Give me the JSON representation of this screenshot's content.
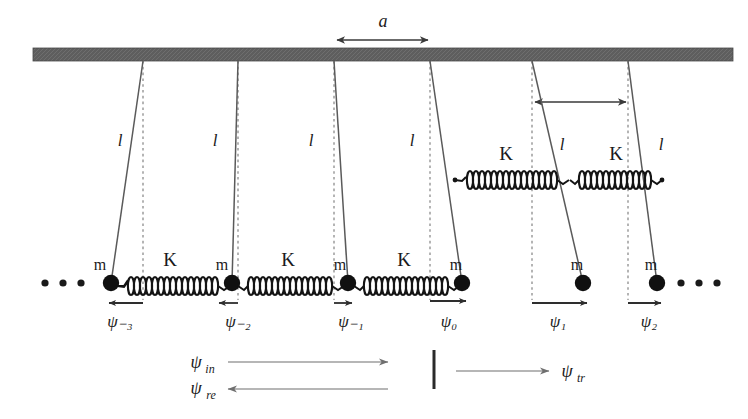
{
  "figure": {
    "colors": {
      "ceiling": "#595959",
      "ink": "#1a1a1a",
      "rod": "#555555",
      "dashed": "#8a8a8a",
      "arrow": "#3a3a3a",
      "faint_arrow": "#7a7a7a",
      "spring": "#141414",
      "mass": "#101010"
    },
    "ceiling": {
      "x": 33,
      "y": 48,
      "width": 700,
      "height": 13
    },
    "lattice_spacing": {
      "label": "a",
      "arrow_y": 40,
      "x_start": 335,
      "x_end": 430,
      "label_x": 383,
      "label_y": 26
    },
    "spacing_arrow_right": {
      "arrow_y": 102,
      "x_start": 533,
      "x_end": 628
    },
    "rod_length_label": "l",
    "spring_label": "K",
    "mass_label": "m",
    "ellipsis_left": {
      "x_positions": [
        45,
        63,
        81
      ],
      "y": 283
    },
    "ellipsis_right": {
      "x_positions": [
        681,
        699,
        717
      ],
      "y": 283
    },
    "pendulums": [
      {
        "id": "psi-minus-3",
        "pivot_x": 143,
        "mass_x": 111,
        "mass_y": 283,
        "displacement_label": "ψ₋₃",
        "displacement_sign": "negative",
        "arrow_length": 36,
        "label_x": 120,
        "label_y": 325,
        "l_label_x": 120,
        "l_label_y": 146,
        "m_label_x": 100,
        "m_label_y": 266,
        "spring_raised": false
      },
      {
        "id": "psi-minus-2",
        "pivot_x": 238,
        "mass_x": 232,
        "mass_y": 283,
        "displacement_label": "ψ₋₂",
        "displacement_sign": "negative",
        "arrow_length": 20,
        "label_x": 238,
        "label_y": 325,
        "l_label_x": 215,
        "l_label_y": 146,
        "m_label_x": 222,
        "m_label_y": 266,
        "spring_raised": false
      },
      {
        "id": "psi-minus-1",
        "pivot_x": 334,
        "mass_x": 348,
        "mass_y": 283,
        "displacement_label": "ψ₋₁",
        "displacement_sign": "positive",
        "arrow_length": 18,
        "label_x": 351,
        "label_y": 325,
        "l_label_x": 311,
        "l_label_y": 146,
        "m_label_x": 340,
        "m_label_y": 266,
        "spring_raised": false
      },
      {
        "id": "psi-0",
        "pivot_x": 430,
        "mass_x": 462,
        "mass_y": 283,
        "displacement_label": "ψ₀",
        "displacement_sign": "positive",
        "arrow_length": 36,
        "label_x": 447,
        "label_y": 325,
        "l_label_x": 412,
        "l_label_y": 146,
        "m_label_x": 455,
        "m_label_y": 266,
        "spring_raised": true
      },
      {
        "id": "psi-1",
        "pivot_x": 532,
        "mass_x": 583,
        "mass_y": 283,
        "displacement_label": "ψ₁",
        "displacement_sign": "positive",
        "arrow_length": 53,
        "label_x": 556,
        "label_y": 325,
        "l_label_x": 562,
        "l_label_y": 146,
        "m_label_x": 574,
        "m_label_y": 266,
        "spring_raised": true
      },
      {
        "id": "psi-2",
        "pivot_x": 628,
        "mass_x": 657,
        "mass_y": 283,
        "displacement_label": "ψ₂",
        "displacement_sign": "positive",
        "arrow_length": 32,
        "label_x": 648,
        "label_y": 325,
        "l_label_x": 660,
        "l_label_y": 146,
        "m_label_x": 650,
        "m_label_y": 266,
        "spring_raised": false
      }
    ],
    "springs": [
      {
        "id": "spring-1",
        "x1": 117,
        "x2": 226,
        "y": 286,
        "label": "K",
        "label_x": 170,
        "label_y": 266
      },
      {
        "id": "spring-2",
        "x1": 238,
        "x2": 342,
        "y": 286,
        "label": "K",
        "label_x": 288,
        "label_y": 266
      },
      {
        "id": "spring-3",
        "x1": 354,
        "x2": 456,
        "y": 286,
        "label": "K",
        "label_x": 404,
        "label_y": 266
      },
      {
        "id": "spring-4",
        "x1": 455,
        "x2": 568,
        "y": 180,
        "label": "K",
        "label_x": 506,
        "label_y": 160
      },
      {
        "id": "spring-5",
        "x1": 570,
        "x2": 660,
        "y": 180,
        "label": "K",
        "label_x": 616,
        "label_y": 160
      }
    ],
    "wave_legend": {
      "incident": {
        "label": "ψ",
        "subscript": "in",
        "label_x": 198,
        "label_y": 365,
        "arrow_x1": 230,
        "arrow_x2": 390,
        "arrow_y": 362,
        "direction": "right"
      },
      "reflected": {
        "label": "ψ",
        "subscript": "re",
        "label_x": 198,
        "label_y": 392,
        "arrow_x1": 390,
        "arrow_x2": 230,
        "arrow_y": 388,
        "direction": "left"
      },
      "transmitted": {
        "label": "ψ",
        "subscript": "tr",
        "label_x": 563,
        "label_y": 375,
        "arrow_x1": 455,
        "arrow_x2": 550,
        "arrow_y": 371,
        "direction": "right"
      },
      "divider": {
        "x": 434,
        "y1": 350,
        "y2": 389
      }
    }
  }
}
